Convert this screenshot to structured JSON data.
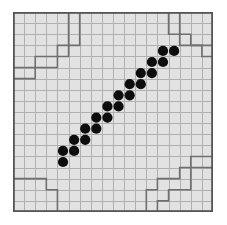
{
  "puzzle": {
    "title": "grid-puzzle-board",
    "grid": {
      "cols": 18,
      "rows": 18,
      "cell_px": 11.1,
      "origin_x": 13,
      "origin_y": 12,
      "width_px": 200,
      "height_px": 200
    },
    "colors": {
      "page_background": "#ffffff",
      "board_background": "#e2e2e2",
      "grid_line": "#b0b0b0",
      "region_line": "#6f6f6f",
      "outer_border": "#555555",
      "dot_fill": "#0d0d0d"
    },
    "dot_label": "black-stone",
    "dot_radius_cells": 0.46,
    "dot_count": 21,
    "dots": [
      {
        "col": 4,
        "row": 13
      },
      {
        "col": 4,
        "row": 12
      },
      {
        "col": 5,
        "row": 12
      },
      {
        "col": 5,
        "row": 11
      },
      {
        "col": 6,
        "row": 11
      },
      {
        "col": 6,
        "row": 10
      },
      {
        "col": 7,
        "row": 10
      },
      {
        "col": 7,
        "row": 9
      },
      {
        "col": 8,
        "row": 9
      },
      {
        "col": 8,
        "row": 8
      },
      {
        "col": 9,
        "row": 8
      },
      {
        "col": 9,
        "row": 7
      },
      {
        "col": 10,
        "row": 7
      },
      {
        "col": 10,
        "row": 6
      },
      {
        "col": 11,
        "row": 6
      },
      {
        "col": 11,
        "row": 5
      },
      {
        "col": 12,
        "row": 5
      },
      {
        "col": 12,
        "row": 4
      },
      {
        "col": 13,
        "row": 4
      },
      {
        "col": 13,
        "row": 3
      },
      {
        "col": 14,
        "row": 3
      }
    ],
    "region_paths": [
      "M 0,6 L 2,6 L 2,5 L 4,5 L 4,4 L 5,4 L 5,3 L 6,3 L 6,0",
      "M 0,5 L 2,5 L 2,4 L 4,4 L 4,3 L 5,3 L 5,0",
      "M 0,15 L 3,15 L 3,16 L 4,16 L 4,18",
      "M 12,18 L 12,16 L 13,16 L 13,15 L 15,15 L 15,14 L 16,14 L 16,13 L 18,13",
      "M 13,18 L 13,17 L 14,17 L 14,16 L 16,16 L 16,14 L 18,14",
      "M 14,0 L 14,2 L 15,2 L 15,3 L 17,3 L 17,4 L 18,4",
      "M 15,0 L 15,2 L 16,2 L 16,3 L 18,3"
    ]
  }
}
